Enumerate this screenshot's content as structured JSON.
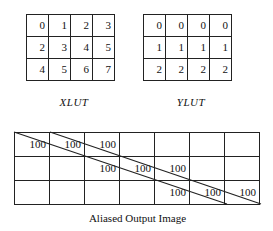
{
  "xlut": {
    "caption": "XLUT",
    "rows": [
      [
        "0",
        "1",
        "2",
        "3"
      ],
      [
        "2",
        "3",
        "4",
        "5"
      ],
      [
        "4",
        "5",
        "6",
        "7"
      ]
    ]
  },
  "ylut": {
    "caption": "YLUT",
    "rows": [
      [
        "0",
        "0",
        "0",
        "0"
      ],
      [
        "1",
        "1",
        "1",
        "1"
      ],
      [
        "2",
        "2",
        "2",
        "2"
      ]
    ]
  },
  "output": {
    "caption": "Aliased Output Image",
    "rows": [
      [
        "100",
        "100",
        "100",
        "",
        "",
        "",
        ""
      ],
      [
        "",
        "",
        "100",
        "100",
        "100",
        "",
        ""
      ],
      [
        "",
        "",
        "",
        "",
        "100",
        "100",
        "100"
      ]
    ]
  }
}
